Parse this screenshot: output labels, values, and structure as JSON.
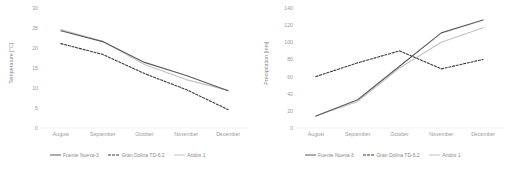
{
  "charts": [
    {
      "panel_name": "temperature-chart",
      "ylabel": "Temperature [°C]",
      "xlabel": "",
      "yticks": [
        "0",
        "5",
        "10",
        "15",
        "20",
        "25",
        "30"
      ],
      "categories": [
        "August",
        "September",
        "October",
        "November",
        "December"
      ],
      "legend": [
        {
          "label": "Fuente Nueva-3",
          "color": "#5a5a5a",
          "style": "solid"
        },
        {
          "label": "Gran Dolina TD-6.2",
          "color": "#3b3b3b",
          "style": "dashed"
        },
        {
          "label": "Aridos 1",
          "color": "#c2c2c2",
          "style": "solid"
        }
      ],
      "chart_data": {
        "type": "line",
        "title": "",
        "xlabel": "",
        "ylabel": "Temperature [°C]",
        "categories": [
          "August",
          "September",
          "October",
          "November",
          "December"
        ],
        "ylim": [
          0,
          30
        ],
        "yticks": [
          0,
          5,
          10,
          15,
          20,
          25,
          30
        ],
        "grid": false,
        "legend_position": "bottom",
        "series": [
          {
            "name": "Fuente Nueva-3",
            "values": [
              24.3,
              21.6,
              16.4,
              13.1,
              9.3
            ],
            "color": "#5a5a5a",
            "style": "solid"
          },
          {
            "name": "Gran Dolina TD-6.2",
            "values": [
              21.1,
              18.4,
              13.6,
              9.6,
              4.6
            ],
            "color": "#3b3b3b",
            "style": "dashed"
          },
          {
            "name": "Aridos 1",
            "values": [
              24.6,
              21.7,
              15.9,
              12.1,
              9.4
            ],
            "color": "#c2c2c2",
            "style": "solid"
          }
        ]
      }
    },
    {
      "panel_name": "precipitation-chart",
      "ylabel": "Precipitation [mm]",
      "xlabel": "",
      "yticks": [
        "0",
        "20",
        "40",
        "60",
        "80",
        "100",
        "120",
        "140"
      ],
      "categories": [
        "August",
        "September",
        "October",
        "November",
        "December"
      ],
      "legend": [
        {
          "label": "Fuente Nueva-3",
          "color": "#5a5a5a",
          "style": "solid"
        },
        {
          "label": "Gran Dolina TD-6.2",
          "color": "#3b3b3b",
          "style": "dashed"
        },
        {
          "label": "Aridos 1",
          "color": "#c2c2c2",
          "style": "solid"
        }
      ],
      "chart_data": {
        "type": "line",
        "title": "",
        "xlabel": "",
        "ylabel": "Precipitation [mm]",
        "categories": [
          "August",
          "September",
          "October",
          "November",
          "December"
        ],
        "ylim": [
          0,
          140
        ],
        "yticks": [
          0,
          20,
          40,
          60,
          80,
          100,
          120,
          140
        ],
        "grid": false,
        "legend_position": "bottom",
        "series": [
          {
            "name": "Fuente Nueva-3",
            "values": [
              14,
              33,
              72,
              111,
              126
            ],
            "color": "#5a5a5a",
            "style": "solid"
          },
          {
            "name": "Gran Dolina TD-6.2",
            "values": [
              60,
              76,
              90,
              69,
              80
            ],
            "color": "#3b3b3b",
            "style": "dashed"
          },
          {
            "name": "Aridos 1",
            "values": [
              14,
              31,
              70,
              100,
              117
            ],
            "color": "#c2c2c2",
            "style": "solid"
          }
        ]
      }
    }
  ]
}
